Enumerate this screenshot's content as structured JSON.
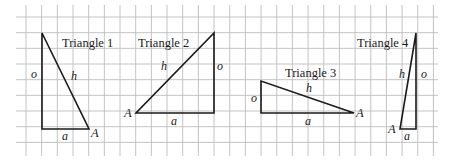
{
  "diagram": {
    "grid": {
      "x0": 26,
      "y0": 17,
      "step": 15.67,
      "cols": 27,
      "rows": 9,
      "left": 16,
      "right": 438,
      "top": 5,
      "bottom": 156,
      "color": "#bdbdbd"
    },
    "triangles": [
      {
        "title": "Triangle 1",
        "points": "42,33 42,129 89,129",
        "title_pos": [
          62,
          47
        ],
        "labels": {
          "o": "o",
          "h": "h",
          "a": "a",
          "A": "A"
        },
        "label_pos": {
          "o": [
            31,
            78
          ],
          "h": [
            71,
            80
          ],
          "a": [
            62,
            140
          ],
          "A": [
            91,
            137
          ]
        }
      },
      {
        "title": "Triangle 2",
        "points": "136,113 214,113 214,33",
        "title_pos": [
          138,
          47
        ],
        "labels": {
          "o": "o",
          "h": "h",
          "a": "a",
          "A": "A"
        },
        "label_pos": {
          "o": [
            216,
            70
          ],
          "h": [
            161,
            70
          ],
          "a": [
            171,
            125
          ],
          "A": [
            125,
            117
          ]
        }
      },
      {
        "title": "Triangle 3",
        "points": "261,81 261,113 354,113",
        "title_pos": [
          285,
          78
        ],
        "labels": {
          "o": "o",
          "h": "h",
          "a": "a",
          "A": "A"
        },
        "label_pos": {
          "o": [
            250,
            102
          ],
          "h": [
            306,
            92
          ],
          "a": [
            305,
            125
          ],
          "A": [
            356,
            117
          ]
        }
      },
      {
        "title": "Triangle 4",
        "points": "416,33 416,129 400,129",
        "title_pos": [
          357,
          47
        ],
        "labels": {
          "o": "o",
          "h": "h",
          "a": "a",
          "A": "A"
        },
        "label_pos": {
          "o": [
            420,
            78
          ],
          "h": [
            399,
            78
          ],
          "a": [
            403,
            140
          ],
          "A": [
            388,
            133
          ]
        }
      }
    ]
  }
}
